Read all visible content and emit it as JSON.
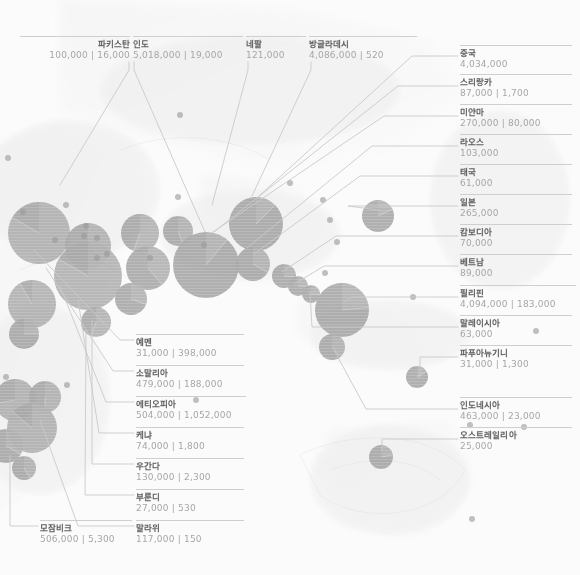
{
  "meta": {
    "view": "world-bubble-map",
    "palette": {
      "background": "#fbfbfb",
      "land": "#efefef",
      "bubble_fill": "#8c8c8c",
      "bubble_small": "#9a9a9a",
      "leader_line": "#c9c9c9",
      "label_name": "#5d5d5d",
      "label_value": "#a6a6a6",
      "rule": "#cfcfcf"
    },
    "value_separator": "|"
  },
  "chart_data": {
    "type": "scatter",
    "title": "",
    "xlabel": "",
    "ylabel": "",
    "series": [
      {
        "name": "primary_value",
        "label": "value_1"
      },
      {
        "name": "secondary_value",
        "label": "value_2"
      }
    ]
  },
  "labels": {
    "top": [
      {
        "name": "파키스탄",
        "values": "100,000 | 16,000",
        "align": "right",
        "x": 20,
        "y": 36,
        "w": 110
      },
      {
        "name": "인도",
        "values": "5,018,000 | 19,000",
        "align": "left",
        "x": 133,
        "y": 36,
        "w": 110
      },
      {
        "name": "네팔",
        "values": "121,000",
        "align": "left",
        "x": 246,
        "y": 36,
        "w": 60
      },
      {
        "name": "방글라데시",
        "values": "4,086,000 | 520",
        "align": "left",
        "x": 309,
        "y": 36,
        "w": 108
      }
    ],
    "right": [
      {
        "name": "중국",
        "values": "4,034,000",
        "x": 460,
        "y": 45,
        "w": 112
      },
      {
        "name": "스리랑카",
        "values": "87,000 | 1,700",
        "x": 460,
        "y": 74,
        "w": 112
      },
      {
        "name": "미얀마",
        "values": "270,000 | 80,000",
        "x": 460,
        "y": 104,
        "w": 112
      },
      {
        "name": "라오스",
        "values": "103,000",
        "x": 460,
        "y": 134,
        "w": 112
      },
      {
        "name": "태국",
        "values": "61,000",
        "x": 460,
        "y": 164,
        "w": 112
      },
      {
        "name": "일본",
        "values": "265,000",
        "x": 460,
        "y": 194,
        "w": 112
      },
      {
        "name": "캄보디아",
        "values": "70,000",
        "x": 460,
        "y": 224,
        "w": 112
      },
      {
        "name": "베트남",
        "values": "89,000",
        "x": 460,
        "y": 254,
        "w": 112
      },
      {
        "name": "필리핀",
        "values": "4,094,000 | 183,000",
        "x": 460,
        "y": 285,
        "w": 116
      },
      {
        "name": "말레이시아",
        "values": "63,000",
        "x": 460,
        "y": 315,
        "w": 112
      },
      {
        "name": "파푸아뉴기니",
        "values": "31,000 | 1,300",
        "x": 460,
        "y": 345,
        "w": 112
      },
      {
        "name": "인도네시아",
        "values": "463,000 | 23,000",
        "x": 460,
        "y": 397,
        "w": 112
      },
      {
        "name": "오스트레일리아",
        "values": "25,000",
        "x": 460,
        "y": 427,
        "w": 112
      }
    ],
    "bottom_left": [
      {
        "name": "예멘",
        "values": "31,000 | 398,000",
        "x": 136,
        "y": 334,
        "w": 108
      },
      {
        "name": "소말리아",
        "values": "479,000 | 188,000",
        "x": 136,
        "y": 365,
        "w": 108
      },
      {
        "name": "에티오피아",
        "values": "504,000 | 1,052,000",
        "x": 136,
        "y": 396,
        "w": 110
      },
      {
        "name": "케냐",
        "values": "74,000 | 1,800",
        "x": 136,
        "y": 427,
        "w": 108
      },
      {
        "name": "우간다",
        "values": "130,000 | 2,300",
        "x": 136,
        "y": 458,
        "w": 108
      },
      {
        "name": "부룬디",
        "values": "27,000 | 530",
        "x": 136,
        "y": 489,
        "w": 108
      },
      {
        "name": "말라위",
        "values": "117,000 | 150",
        "x": 136,
        "y": 520,
        "w": 108
      },
      {
        "name": "모잠비크",
        "values": "506,000 | 5,300",
        "x": 40,
        "y": 520,
        "w": 92
      }
    ]
  },
  "bubbles": [
    {
      "cx": 39,
      "cy": 233,
      "r": 31,
      "slice": 300
    },
    {
      "cx": 88,
      "cy": 246,
      "r": 23,
      "slice": 250
    },
    {
      "cx": 140,
      "cy": 233,
      "r": 19,
      "slice": 200
    },
    {
      "cx": 178,
      "cy": 231,
      "r": 15,
      "slice": 160
    },
    {
      "cx": 88,
      "cy": 276,
      "r": 34,
      "slice": 300
    },
    {
      "cx": 148,
      "cy": 268,
      "r": 22,
      "slice": 140
    },
    {
      "cx": 131,
      "cy": 299,
      "r": 16,
      "slice": 110
    },
    {
      "cx": 96,
      "cy": 322,
      "r": 15,
      "slice": 200
    },
    {
      "cx": 32,
      "cy": 304,
      "r": 24,
      "slice": 330
    },
    {
      "cx": 24,
      "cy": 334,
      "r": 15,
      "slice": 90
    },
    {
      "cx": 15,
      "cy": 400,
      "r": 21,
      "slice": 260
    },
    {
      "cx": 45,
      "cy": 397,
      "r": 16,
      "slice": 180
    },
    {
      "cx": 32,
      "cy": 428,
      "r": 25,
      "slice": 310
    },
    {
      "cx": 6,
      "cy": 446,
      "r": 17,
      "slice": 120
    },
    {
      "cx": 24,
      "cy": 468,
      "r": 12,
      "slice": 150
    },
    {
      "cx": 206,
      "cy": 265,
      "r": 33,
      "slice": 40
    },
    {
      "cx": 256,
      "cy": 224,
      "r": 27,
      "slice": 45
    },
    {
      "cx": 253,
      "cy": 264,
      "r": 17,
      "slice": 120
    },
    {
      "cx": 284,
      "cy": 276,
      "r": 12,
      "slice": 95
    },
    {
      "cx": 298,
      "cy": 286,
      "r": 10,
      "slice": 95
    },
    {
      "cx": 311,
      "cy": 294,
      "r": 9,
      "slice": 95
    },
    {
      "cx": 342,
      "cy": 310,
      "r": 27,
      "slice": 85
    },
    {
      "cx": 332,
      "cy": 347,
      "r": 13,
      "slice": 140
    },
    {
      "cx": 378,
      "cy": 216,
      "r": 16,
      "slice": 65
    },
    {
      "cx": 417,
      "cy": 377,
      "r": 11,
      "slice": 60
    },
    {
      "cx": 381,
      "cy": 457,
      "r": 12,
      "slice": 80
    }
  ],
  "dots": [
    {
      "cx": 8,
      "cy": 158,
      "r": 3
    },
    {
      "cx": 23,
      "cy": 212,
      "r": 3
    },
    {
      "cx": 66,
      "cy": 205,
      "r": 3
    },
    {
      "cx": 86,
      "cy": 226,
      "r": 3
    },
    {
      "cx": 84,
      "cy": 236,
      "r": 3
    },
    {
      "cx": 97,
      "cy": 238,
      "r": 3
    },
    {
      "cx": 97,
      "cy": 258,
      "r": 3
    },
    {
      "cx": 55,
      "cy": 240,
      "r": 3
    },
    {
      "cx": 107,
      "cy": 254,
      "r": 3
    },
    {
      "cx": 150,
      "cy": 258,
      "r": 3
    },
    {
      "cx": 180,
      "cy": 115,
      "r": 3
    },
    {
      "cx": 178,
      "cy": 197,
      "r": 3
    },
    {
      "cx": 204,
      "cy": 245,
      "r": 3
    },
    {
      "cx": 290,
      "cy": 183,
      "r": 3
    },
    {
      "cx": 325,
      "cy": 273,
      "r": 3
    },
    {
      "cx": 330,
      "cy": 220,
      "r": 3
    },
    {
      "cx": 323,
      "cy": 200,
      "r": 3
    },
    {
      "cx": 337,
      "cy": 242,
      "r": 3
    },
    {
      "cx": 413,
      "cy": 297,
      "r": 3
    },
    {
      "cx": 470,
      "cy": 425,
      "r": 3
    },
    {
      "cx": 472,
      "cy": 519,
      "r": 3
    },
    {
      "cx": 536,
      "cy": 331,
      "r": 3
    },
    {
      "cx": 524,
      "cy": 427,
      "r": 3
    },
    {
      "cx": 196,
      "cy": 400,
      "r": 3
    },
    {
      "cx": 67,
      "cy": 385,
      "r": 3
    },
    {
      "cx": 6,
      "cy": 377,
      "r": 3
    }
  ],
  "leaders": {
    "top": [
      {
        "path": "M 129,62 L 129,70 L 60,185"
      },
      {
        "path": "M 134,62 L 134,70 L 205,232"
      },
      {
        "path": "M 248,62 L 248,70 L 212,205"
      },
      {
        "path": "M 311,62 L 311,70 L 252,196"
      }
    ],
    "right": [
      {
        "path": "M 458,56  L 412,56  L 258,197"
      },
      {
        "path": "M 458,86  L 398,86  L 214,232"
      },
      {
        "path": "M 458,116 L 384,116 L 210,234"
      },
      {
        "path": "M 458,146 L 372,146 L 247,248"
      },
      {
        "path": "M 458,176 L 360,176 L 254,254"
      },
      {
        "path": "M 458,206 L 348,206 L 378,210"
      },
      {
        "path": "M 458,236 L 336,236 L 282,272"
      },
      {
        "path": "M 458,266 L 324,266 L 296,283"
      },
      {
        "path": "M 458,297 L 352,297 L 344,302"
      },
      {
        "path": "M 458,327 L 312,327 L 310,292"
      },
      {
        "path": "M 458,357 L 420,357 L 420,378"
      },
      {
        "path": "M 458,409 L 366,409 L 334,350"
      },
      {
        "path": "M 458,439 L 382,439 L 382,450"
      }
    ],
    "bottom_left": [
      {
        "path": "M 134,340 L 120,340 L 34,250"
      },
      {
        "path": "M 134,371 L 113,371 L 46,268"
      },
      {
        "path": "M 134,402 L 106,402 L 60,286"
      },
      {
        "path": "M 134,433 L 99,433  L 78,300"
      },
      {
        "path": "M 134,464 L 92,464  L 92,320"
      },
      {
        "path": "M 134,495 L 85,495  L 86,330"
      },
      {
        "path": "M 134,526 L 78,526  L 40,420"
      },
      {
        "path": "M 38,526  L 10,526  L 10,455"
      }
    ]
  }
}
